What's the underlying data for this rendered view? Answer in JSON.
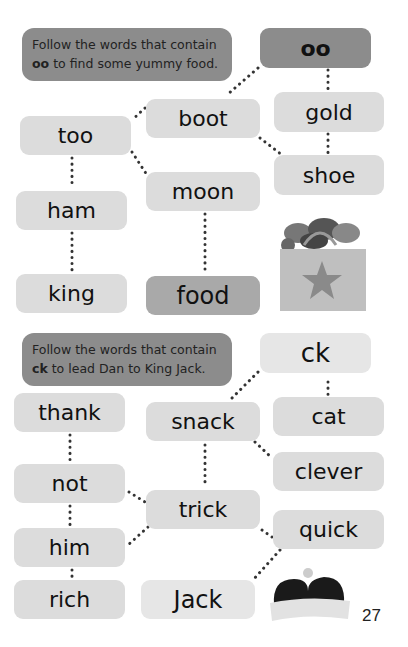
{
  "puzzle1": {
    "instruction_line1": "Follow the words that contain",
    "instruction_key": "oo",
    "instruction_line2_rest": " to find some yummy food.",
    "words": {
      "start": "oo",
      "boot": "boot",
      "gold": "gold",
      "too": "too",
      "shoe": "shoe",
      "moon": "moon",
      "ham": "ham",
      "king": "king",
      "food": "food"
    },
    "image": "shopping-bag-with-food"
  },
  "puzzle2": {
    "instruction_line1": "Follow the words that contain",
    "instruction_key": "ck",
    "instruction_line2_rest": " to lead Dan to King Jack.",
    "words": {
      "start": "ck",
      "thank": "thank",
      "snack": "snack",
      "cat": "cat",
      "clever": "clever",
      "not": "not",
      "trick": "trick",
      "quick": "quick",
      "him": "him",
      "rich": "rich",
      "jack": "Jack"
    },
    "image": "crown"
  },
  "page_number": "27"
}
